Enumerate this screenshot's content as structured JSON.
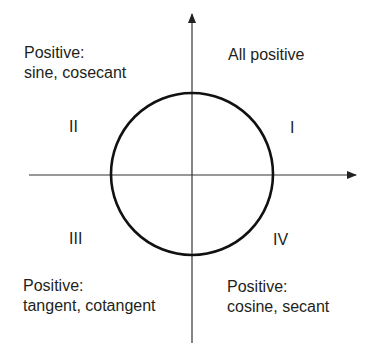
{
  "diagram": {
    "quadrants": [
      {
        "numeral": "I",
        "heading": "All positive",
        "functions": ""
      },
      {
        "numeral": "II",
        "heading": "Positive:",
        "functions": "sine, cosecant"
      },
      {
        "numeral": "III",
        "heading": "Positive:",
        "functions": "tangent, cotangent"
      },
      {
        "numeral": "IV",
        "heading": "Positive:",
        "functions": "cosine, secant"
      }
    ],
    "colors": {
      "stroke": "#111111",
      "text": "#231f20",
      "axis": "#333333"
    }
  }
}
